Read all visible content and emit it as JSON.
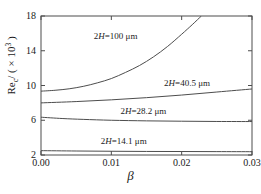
{
  "chart_data": {
    "type": "line",
    "title": "",
    "xlabel": "β",
    "ylabel_text": "Re",
    "ylabel_sub": "c",
    "ylabel_scale": "/ ( × 10",
    "ylabel_exp": "3",
    "ylabel_close": ")",
    "xlim": [
      0.0,
      0.03
    ],
    "ylim": [
      2,
      18
    ],
    "xticks": [
      "0.00",
      "0.01",
      "0.02",
      "0.03"
    ],
    "xtick_values": [
      0.0,
      0.01,
      0.02,
      0.03
    ],
    "yticks": [
      "2",
      "6",
      "10",
      "14",
      "18"
    ],
    "ytick_values": [
      2,
      6,
      10,
      14,
      18
    ],
    "grid": false,
    "legend_position": "inline-annotations",
    "line_color": "#4d4d4d",
    "axis_color": "#4d4d4d",
    "series": [
      {
        "name": "2H=100 µm",
        "label": "2H=100  μm",
        "x": [
          0.0,
          0.002,
          0.004,
          0.006,
          0.008,
          0.01,
          0.012,
          0.014,
          0.016,
          0.018,
          0.02,
          0.0215,
          0.0228
        ],
        "values": [
          9.35,
          9.45,
          9.62,
          9.9,
          10.3,
          10.8,
          11.5,
          12.3,
          13.3,
          14.5,
          15.9,
          17.0,
          18.0
        ]
      },
      {
        "name": "2H=40.5 µm",
        "label": "2H=40.5  μm",
        "x": [
          0.0,
          0.005,
          0.01,
          0.015,
          0.02,
          0.025,
          0.03
        ],
        "values": [
          8.0,
          8.15,
          8.35,
          8.6,
          8.9,
          9.25,
          9.6
        ]
      },
      {
        "name": "2H=28.2 µm",
        "label": "2H=28.2  μm",
        "x": [
          0.0,
          0.003,
          0.006,
          0.01,
          0.015,
          0.02,
          0.025,
          0.03
        ],
        "values": [
          6.35,
          6.2,
          6.1,
          6.0,
          5.93,
          5.89,
          5.86,
          5.85
        ]
      },
      {
        "name": "2H=14.1 µm",
        "label": "2H=14.1  μm",
        "x": [
          0.0,
          0.005,
          0.01,
          0.015,
          0.02,
          0.025,
          0.03
        ],
        "values": [
          2.5,
          2.46,
          2.43,
          2.41,
          2.4,
          2.39,
          2.38
        ]
      }
    ],
    "annotations": [
      {
        "text": "2H=100  μm",
        "x": 0.0075,
        "y": 15.6
      },
      {
        "text": "2H=40.5  μm",
        "x": 0.0175,
        "y": 10.15
      },
      {
        "text": "2H=28.2  μm",
        "x": 0.0113,
        "y": 7.0
      },
      {
        "text": "2H=14.1  μm",
        "x": 0.0085,
        "y": 3.55
      }
    ]
  },
  "axis": {
    "xlabel": "β",
    "xticks": [
      "0.00",
      "0.01",
      "0.02",
      "0.03"
    ],
    "yticks": [
      "2",
      "6",
      "10",
      "14",
      "18"
    ]
  },
  "labels": {
    "curve_100": "2H=100  μm",
    "curve_405": "2H=40.5  μm",
    "curve_282": "2H=28.2  μm",
    "curve_141": "2H=14.1  μm",
    "ylabel_prefix": "Re",
    "ylabel_sub": "c",
    "ylabel_mid": "/ ( × 10",
    "ylabel_exp": "3",
    "ylabel_suffix": " )"
  }
}
